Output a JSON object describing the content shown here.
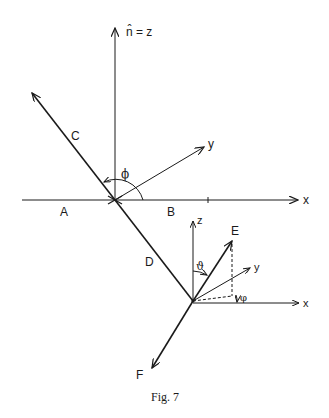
{
  "figure": {
    "caption": "Fig. 7",
    "upper_frame": {
      "vertical_axis_label": "n̂ = z",
      "horizontal_axis_label": "x",
      "oblique_axis_label": "y",
      "angle_label": "ϕ",
      "segment_labels": {
        "A": "A",
        "B": "B",
        "C": "C",
        "D": "D"
      }
    },
    "lower_frame": {
      "z_label": "z",
      "y_label": "y",
      "x_label": "x",
      "polar_angle_label": "ϑ",
      "azimuth_angle_label": "φ",
      "vector_labels": {
        "E": "E",
        "F": "F"
      }
    }
  },
  "colors": {
    "ink": "#1a1a1a",
    "background": "#ffffff"
  }
}
